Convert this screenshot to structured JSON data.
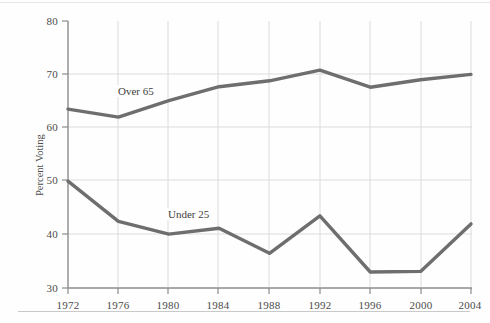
{
  "chart_data": {
    "type": "line",
    "title": "",
    "xlabel": "",
    "ylabel": "Percent Voting",
    "categories": [
      "1972",
      "1976",
      "1980",
      "1984",
      "1988",
      "1992",
      "1996",
      "2000",
      "2004"
    ],
    "x": [
      1972,
      1976,
      1980,
      1984,
      1988,
      1992,
      1996,
      2000,
      2004
    ],
    "xlim": [
      1972,
      2004
    ],
    "ylim": [
      30,
      80
    ],
    "yticks": [
      30,
      40,
      50,
      60,
      70,
      80
    ],
    "xticks": [
      "1972",
      "1976",
      "1980",
      "1984",
      "1988",
      "1992",
      "1996",
      "2000",
      "2004"
    ],
    "grid": true,
    "legend_position": "inline-labels",
    "series": [
      {
        "name": "Over 65",
        "color": "#6e6e6e",
        "values": [
          63.5,
          62.0,
          65.1,
          67.7,
          68.8,
          70.8,
          67.6,
          69.0,
          70.0
        ],
        "label_text": "Over 65"
      },
      {
        "name": "Under 25",
        "color": "#6e6e6e",
        "values": [
          50.0,
          42.5,
          40.1,
          41.2,
          36.5,
          43.5,
          33.0,
          33.1,
          42.0
        ],
        "label_text": "Under 25"
      }
    ],
    "annotations": [
      "Over 65",
      "Under 25"
    ]
  },
  "axes": {
    "y_title": "Percent Voting",
    "y_tick_labels": [
      "80",
      "70",
      "60",
      "50",
      "40",
      "30"
    ],
    "x_tick_labels": [
      "1972",
      "1976",
      "1980",
      "1984",
      "1988",
      "1992",
      "1996",
      "2000",
      "2004"
    ]
  },
  "labels": {
    "over65": "Over 65",
    "under25": "Under 25"
  },
  "colors": {
    "line": "#6e6e6e",
    "grid": "#dcdcdc",
    "axis": "#909090",
    "text": "#4b4b4b",
    "background": "#fefefe"
  }
}
